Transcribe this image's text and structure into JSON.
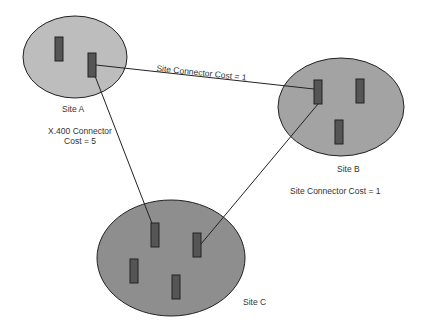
{
  "sites": [
    {
      "name": "Site A",
      "fill": "#bdbdbd"
    },
    {
      "name": "Site B",
      "fill": "#a3a3a3"
    },
    {
      "name": "Site C",
      "fill": "#8e8e8e"
    }
  ],
  "connectors": [
    {
      "label": "Site Connector Cost = 1",
      "from": "Site A",
      "to": "Site B"
    },
    {
      "label_line1": "X.400 Connector",
      "label_line2": "Cost = 5",
      "from": "Site A",
      "to": "Site C"
    },
    {
      "label": "Site Connector Cost = 1",
      "from": "Site B",
      "to": "Site C"
    }
  ],
  "colors": {
    "server": "#555555",
    "outline": "#222222",
    "line": "#222222"
  }
}
